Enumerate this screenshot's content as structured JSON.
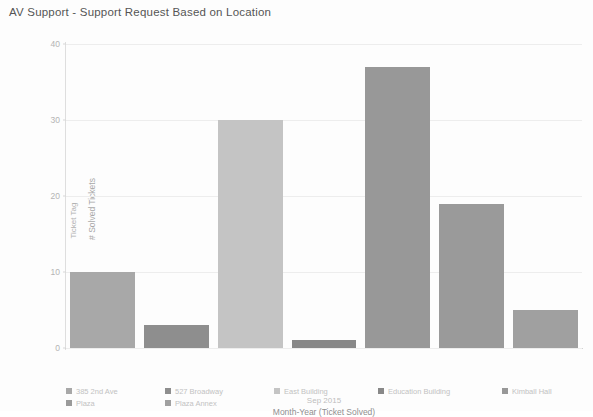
{
  "chart_data": {
    "type": "bar",
    "title": "AV Support - Support Request Based on Location",
    "xlabel": "Month-Year (Ticket Solved)",
    "ylabel": "# Solved Tickets",
    "ylabel_outer": "Ticket Tag",
    "x_tick_labels": [
      "Sep 2015"
    ],
    "categories": [
      "385 2nd Ave",
      "527 Broadway",
      "East Building",
      "Education Building",
      "Kimball Hall",
      "Plaza",
      "Plaza Annex"
    ],
    "values": [
      10,
      3,
      30,
      1,
      37,
      19,
      5
    ],
    "colors": [
      "#a8a8a8",
      "#8e8e8e",
      "#c4c4c4",
      "#888888",
      "#989898",
      "#9a9a9a",
      "#a0a0a0"
    ],
    "ylim": [
      0,
      40
    ],
    "y_ticks": [
      0,
      10,
      20,
      30,
      40
    ],
    "y_tick_labels": [
      "0",
      "10",
      "20",
      "30",
      "40"
    ],
    "grid": true,
    "legend_position": "bottom"
  },
  "legend": {
    "items": [
      {
        "label": "385 2nd Ave",
        "color": "#a8a8a8"
      },
      {
        "label": "527 Broadway",
        "color": "#8e8e8e"
      },
      {
        "label": "East Building",
        "color": "#c4c4c4"
      },
      {
        "label": "Education Building",
        "color": "#888888"
      },
      {
        "label": "Kimball Hall",
        "color": "#989898"
      },
      {
        "label": "Plaza",
        "color": "#9a9a9a"
      },
      {
        "label": "Plaza Annex",
        "color": "#a0a0a0"
      }
    ]
  }
}
